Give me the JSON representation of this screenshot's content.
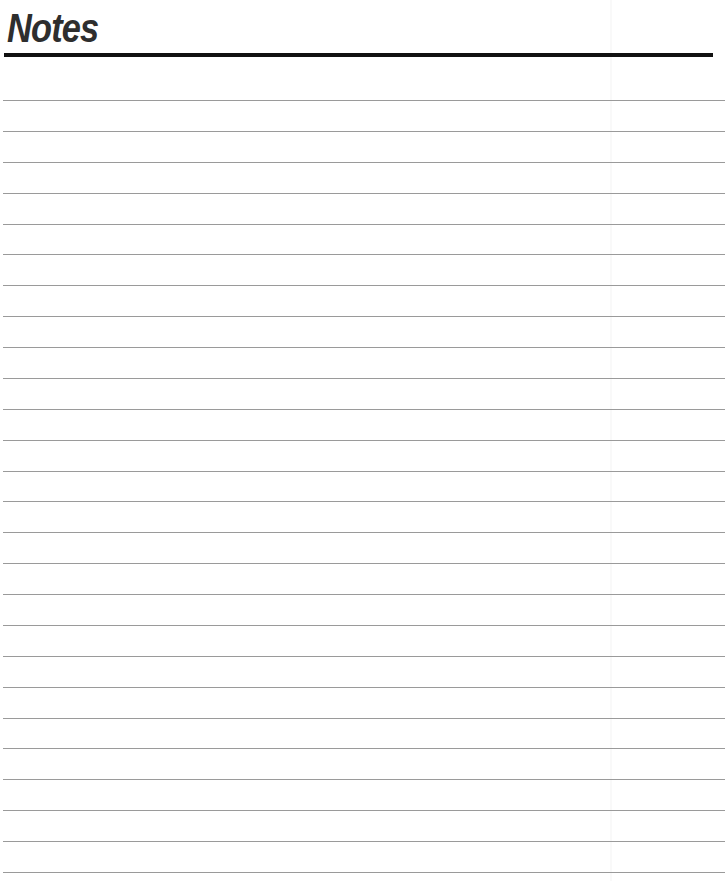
{
  "page": {
    "title": "Notes",
    "rule_count": 26,
    "first_rule_y": 100,
    "rule_spacing": 30.88,
    "colors": {
      "title": "#2e2e2e",
      "title_rule": "#111111",
      "rules": "#9a9a9a",
      "background": "#ffffff"
    }
  }
}
